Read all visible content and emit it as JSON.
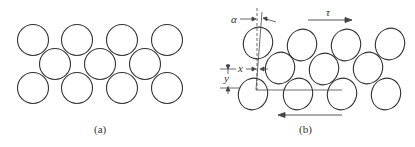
{
  "panel_a": {
    "caption": "(a)",
    "circle_radius": 16,
    "circles": [
      {
        "cx": 33,
        "cy": 40
      },
      {
        "cx": 77,
        "cy": 40
      },
      {
        "cx": 122,
        "cy": 40
      },
      {
        "cx": 167,
        "cy": 40
      },
      {
        "cx": 55,
        "cy": 64
      },
      {
        "cx": 100,
        "cy": 64
      },
      {
        "cx": 145,
        "cy": 64
      },
      {
        "cx": 33,
        "cy": 88
      },
      {
        "cx": 77,
        "cy": 88
      },
      {
        "cx": 122,
        "cy": 88
      },
      {
        "cx": 167,
        "cy": 88
      }
    ]
  },
  "panel_b": {
    "caption": "(b)",
    "labels": {
      "alpha": "α",
      "tau": "τ",
      "x": "x",
      "y": "y"
    },
    "ellipses": [
      {
        "cx": 258,
        "cy": 42
      },
      {
        "cx": 302,
        "cy": 46
      },
      {
        "cx": 346,
        "cy": 46
      },
      {
        "cx": 390,
        "cy": 44
      },
      {
        "cx": 280,
        "cy": 68
      },
      {
        "cx": 324,
        "cy": 69
      },
      {
        "cx": 368,
        "cy": 68
      },
      {
        "cx": 254,
        "cy": 93
      },
      {
        "cx": 298,
        "cy": 93
      },
      {
        "cx": 342,
        "cy": 93
      },
      {
        "cx": 386,
        "cy": 93
      }
    ]
  },
  "colors": {
    "stroke": "#333333",
    "text": "#333333",
    "background": "#ffffff"
  }
}
